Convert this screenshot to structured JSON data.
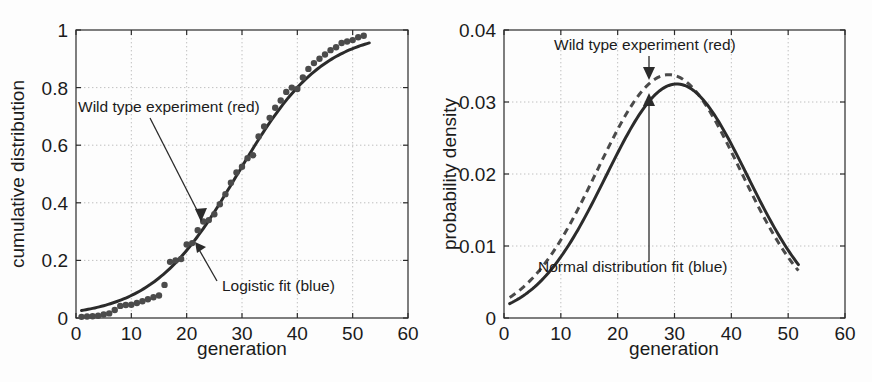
{
  "figure": {
    "background": "#fdfdfd",
    "ink_color": "#2b2b2b",
    "data_color": "#4b4b4b"
  },
  "chart_data": [
    {
      "type": "scatter",
      "panel": "left",
      "title": "",
      "xlabel": "generation",
      "ylabel": "cumulative distribution",
      "xlim": [
        0,
        60
      ],
      "ylim": [
        0,
        1
      ],
      "xticks": [
        0,
        10,
        20,
        30,
        40,
        50,
        60
      ],
      "xticklabels": [
        "0",
        "10",
        "20",
        "30",
        "40",
        "50",
        "60"
      ],
      "yticks": [
        0,
        0.2,
        0.4,
        0.6,
        0.8,
        1
      ],
      "yticklabels": [
        "0",
        "0.2",
        "0.4",
        "0.6",
        "0.8",
        "1"
      ],
      "grid": true,
      "legend_position": "inline-annotations",
      "annotations": [
        {
          "text": "Wild type experiment (red)",
          "target_x": 22.5,
          "target_y": 0.35
        },
        {
          "text": "Logistic fit (blue)",
          "target_x": 22.0,
          "target_y": 0.255
        }
      ],
      "series": [
        {
          "name": "Wild type experiment (red)",
          "style": "markers",
          "color": "#4b4b4b",
          "x": [
            1,
            2,
            3,
            4,
            5,
            6,
            7,
            8,
            9,
            10,
            11,
            12,
            13,
            14,
            15,
            16,
            17,
            18,
            19,
            20,
            21,
            22,
            23,
            24,
            25,
            26,
            27,
            28,
            29,
            30,
            31,
            32,
            33,
            34,
            35,
            36,
            37,
            38,
            39,
            40,
            41,
            42,
            43,
            44,
            45,
            46,
            47,
            48,
            49,
            50,
            51,
            52
          ],
          "y": [
            0.004,
            0.005,
            0.006,
            0.008,
            0.012,
            0.016,
            0.028,
            0.042,
            0.045,
            0.046,
            0.052,
            0.058,
            0.065,
            0.072,
            0.078,
            0.115,
            0.195,
            0.2,
            0.205,
            0.255,
            0.26,
            0.305,
            0.335,
            0.34,
            0.36,
            0.395,
            0.43,
            0.47,
            0.505,
            0.525,
            0.555,
            0.565,
            0.63,
            0.665,
            0.695,
            0.73,
            0.755,
            0.785,
            0.8,
            0.795,
            0.835,
            0.865,
            0.885,
            0.9,
            0.915,
            0.93,
            0.94,
            0.955,
            0.96,
            0.965,
            0.975,
            0.98
          ]
        },
        {
          "name": "Logistic fit (blue)",
          "style": "line",
          "color": "#2b2b2b",
          "fit": "logistic",
          "L": 1.0,
          "k": 0.1285,
          "x0": 29.2,
          "x_range": [
            1,
            53
          ]
        }
      ]
    },
    {
      "type": "line",
      "panel": "right",
      "title": "",
      "xlabel": "generation",
      "ylabel": "probability density",
      "xlim": [
        0,
        60
      ],
      "ylim": [
        0,
        0.04
      ],
      "xticks": [
        0,
        10,
        20,
        30,
        40,
        50,
        60
      ],
      "xticklabels": [
        "0",
        "10",
        "20",
        "30",
        "40",
        "50",
        "60"
      ],
      "yticks": [
        0,
        0.01,
        0.02,
        0.03,
        0.04
      ],
      "yticklabels": [
        "0",
        "0.01",
        "0.02",
        "0.03",
        "0.04"
      ],
      "grid": true,
      "legend_position": "inline-annotations",
      "annotations": [
        {
          "text": "Wild type experiment (red)",
          "target_x": 29.5,
          "target_y": 0.0338
        },
        {
          "text": "Normal distribution fit (blue)",
          "target_x": 29.5,
          "target_y": 0.0322
        }
      ],
      "series": [
        {
          "name": "Wild type experiment (red)",
          "style": "dashed",
          "color": "#4a4a4a",
          "fit": "normal-like",
          "peak_x": 29.0,
          "peak_y": 0.0338,
          "sigma": 12.6,
          "x_range": [
            1,
            52
          ]
        },
        {
          "name": "Normal distribution fit (blue)",
          "style": "line",
          "color": "#2b2b2b",
          "fit": "normal",
          "mu": 30.4,
          "sigma": 12.45,
          "peak_y": 0.0325,
          "x_range": [
            1,
            52
          ]
        }
      ]
    }
  ]
}
